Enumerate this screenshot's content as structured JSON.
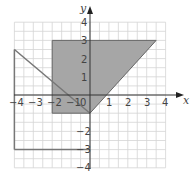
{
  "chart_data": {
    "type": "area",
    "title": "",
    "xlabel": "x",
    "ylabel": "y",
    "xlim": [
      -4,
      4
    ],
    "ylim": [
      -4,
      4
    ],
    "grid": true,
    "minor_grid_per_unit": 2,
    "x_ticks": [
      "-4",
      "-3",
      "-2",
      "-1",
      "0",
      "1",
      "2",
      "3",
      "4"
    ],
    "y_ticks": [
      "-4",
      "-3",
      "-2",
      "-1",
      "1",
      "2",
      "3",
      "4"
    ],
    "shaded_region": {
      "vertices": [
        [
          -2,
          3
        ],
        [
          3.5,
          3
        ],
        [
          0,
          -1
        ],
        [
          -2,
          -1
        ]
      ],
      "fill": "#a6a6a6"
    },
    "lines": [
      {
        "name": "diagonal-line",
        "points": [
          [
            -4,
            2.5
          ],
          [
            0,
            -1
          ]
        ]
      },
      {
        "name": "boundary-left",
        "points": [
          [
            -4,
            2.5
          ],
          [
            -4,
            -3
          ]
        ]
      },
      {
        "name": "boundary-bottom",
        "points": [
          [
            -4,
            -3
          ],
          [
            0,
            -3
          ]
        ]
      }
    ],
    "colors": {
      "grid": "#d4d4d4",
      "axis": "#333333",
      "line": "#777777",
      "shade": "#a6a6a6"
    }
  },
  "labels": {
    "x_axis": "x",
    "y_axis": "y",
    "origin": "0",
    "x_ticks": {
      "m4": "−4",
      "m3": "−3",
      "m2": "−2",
      "m1": "−1",
      "p1": "1",
      "p2": "2",
      "p3": "3",
      "p4": "4"
    },
    "y_ticks": {
      "p4": "4",
      "p3": "3",
      "p2": "2",
      "p1": "1",
      "m1": "−1",
      "m2": "−2",
      "m3": "−3",
      "m4": "−4"
    }
  }
}
